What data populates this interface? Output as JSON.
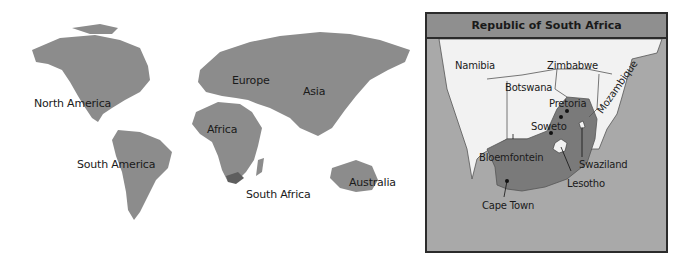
{
  "world_map": {
    "labels": {
      "north_america": "North America",
      "south_america": "South America",
      "europe": "Europe",
      "africa": "Africa",
      "asia": "Asia",
      "australia": "Australia",
      "south_africa": "South Africa"
    },
    "colors": {
      "land": "#8c8c8c",
      "highlight": "#5e5e5e",
      "ocean": "#ffffff"
    }
  },
  "inset_map": {
    "title": "Republic of South Africa",
    "countries": {
      "namibia": "Namibia",
      "botswana": "Botswana",
      "zimbabwe": "Zimbabwe",
      "mozambique": "Mozambique",
      "swaziland": "Swaziland",
      "lesotho": "Lesotho"
    },
    "cities": {
      "pretoria": "Pretoria",
      "soweto": "Soweto",
      "bloemfontein": "Bloemfontein",
      "cape_town": "Cape Town"
    },
    "colors": {
      "ocean": "#a9a9a9",
      "neighbors": "#f2f2f2",
      "south_africa": "#7a7a7a",
      "title_bar": "#8f8f8f"
    }
  }
}
